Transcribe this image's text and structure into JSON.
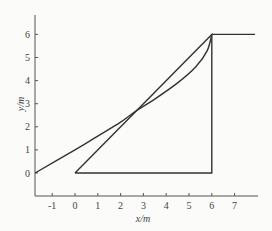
{
  "chart_data": {
    "type": "line",
    "title": "",
    "xlabel": "x/m",
    "ylabel": "y/m",
    "xlim": [
      -1.75,
      7.9
    ],
    "ylim": [
      -1,
      6.8
    ],
    "x_ticks": [
      -1,
      0,
      1,
      2,
      3,
      4,
      5,
      6,
      7
    ],
    "y_ticks": [
      0,
      1,
      2,
      3,
      4,
      5,
      6
    ],
    "grid": false,
    "legend": null,
    "series": [
      {
        "name": "triangle",
        "kind": "polyline",
        "points": [
          [
            0,
            0
          ],
          [
            6,
            6
          ],
          [
            6,
            0
          ],
          [
            0,
            0
          ]
        ]
      },
      {
        "name": "plateau",
        "kind": "polyline",
        "points": [
          [
            6,
            6
          ],
          [
            7.9,
            6
          ]
        ]
      },
      {
        "name": "curve",
        "kind": "curve",
        "points": [
          [
            -1.75,
            0
          ],
          [
            0,
            1
          ],
          [
            1,
            1.6
          ],
          [
            2,
            2.2
          ],
          [
            2.7,
            2.7
          ],
          [
            3.5,
            3.2
          ],
          [
            4.5,
            3.9
          ],
          [
            5.3,
            4.6
          ],
          [
            5.8,
            5.3
          ],
          [
            6,
            6
          ]
        ]
      }
    ],
    "line_color": "#333333",
    "axis_color": "#555555"
  }
}
